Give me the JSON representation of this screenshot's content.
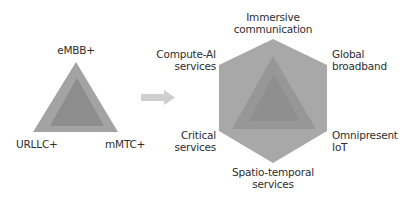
{
  "left_diagram": {
    "labels": {
      "top": "eMBB+",
      "bottom_left": "URLLC+",
      "bottom_right": "mMTC+"
    }
  },
  "right_diagram": {
    "labels": {
      "top": [
        "Immersive",
        "communication"
      ],
      "upper_left": [
        "Compute-AI",
        "services"
      ],
      "upper_right": [
        "Global",
        "broadband"
      ],
      "lower_left": [
        "Critical",
        "services"
      ],
      "lower_right": [
        "Omnipresent",
        "IoT"
      ],
      "bottom": [
        "Spatio-temporal",
        "services"
      ]
    }
  },
  "colors": {
    "hexagon": "#a8a8a8",
    "outer_triangle": "#a3a3a3",
    "inner_triangle": "#8d8d8d",
    "hex_triangle": "#979797",
    "hex_inner_triangle": "#8f8f8f",
    "arrow": "#cfcfcf",
    "text": "#2e2e2e"
  }
}
